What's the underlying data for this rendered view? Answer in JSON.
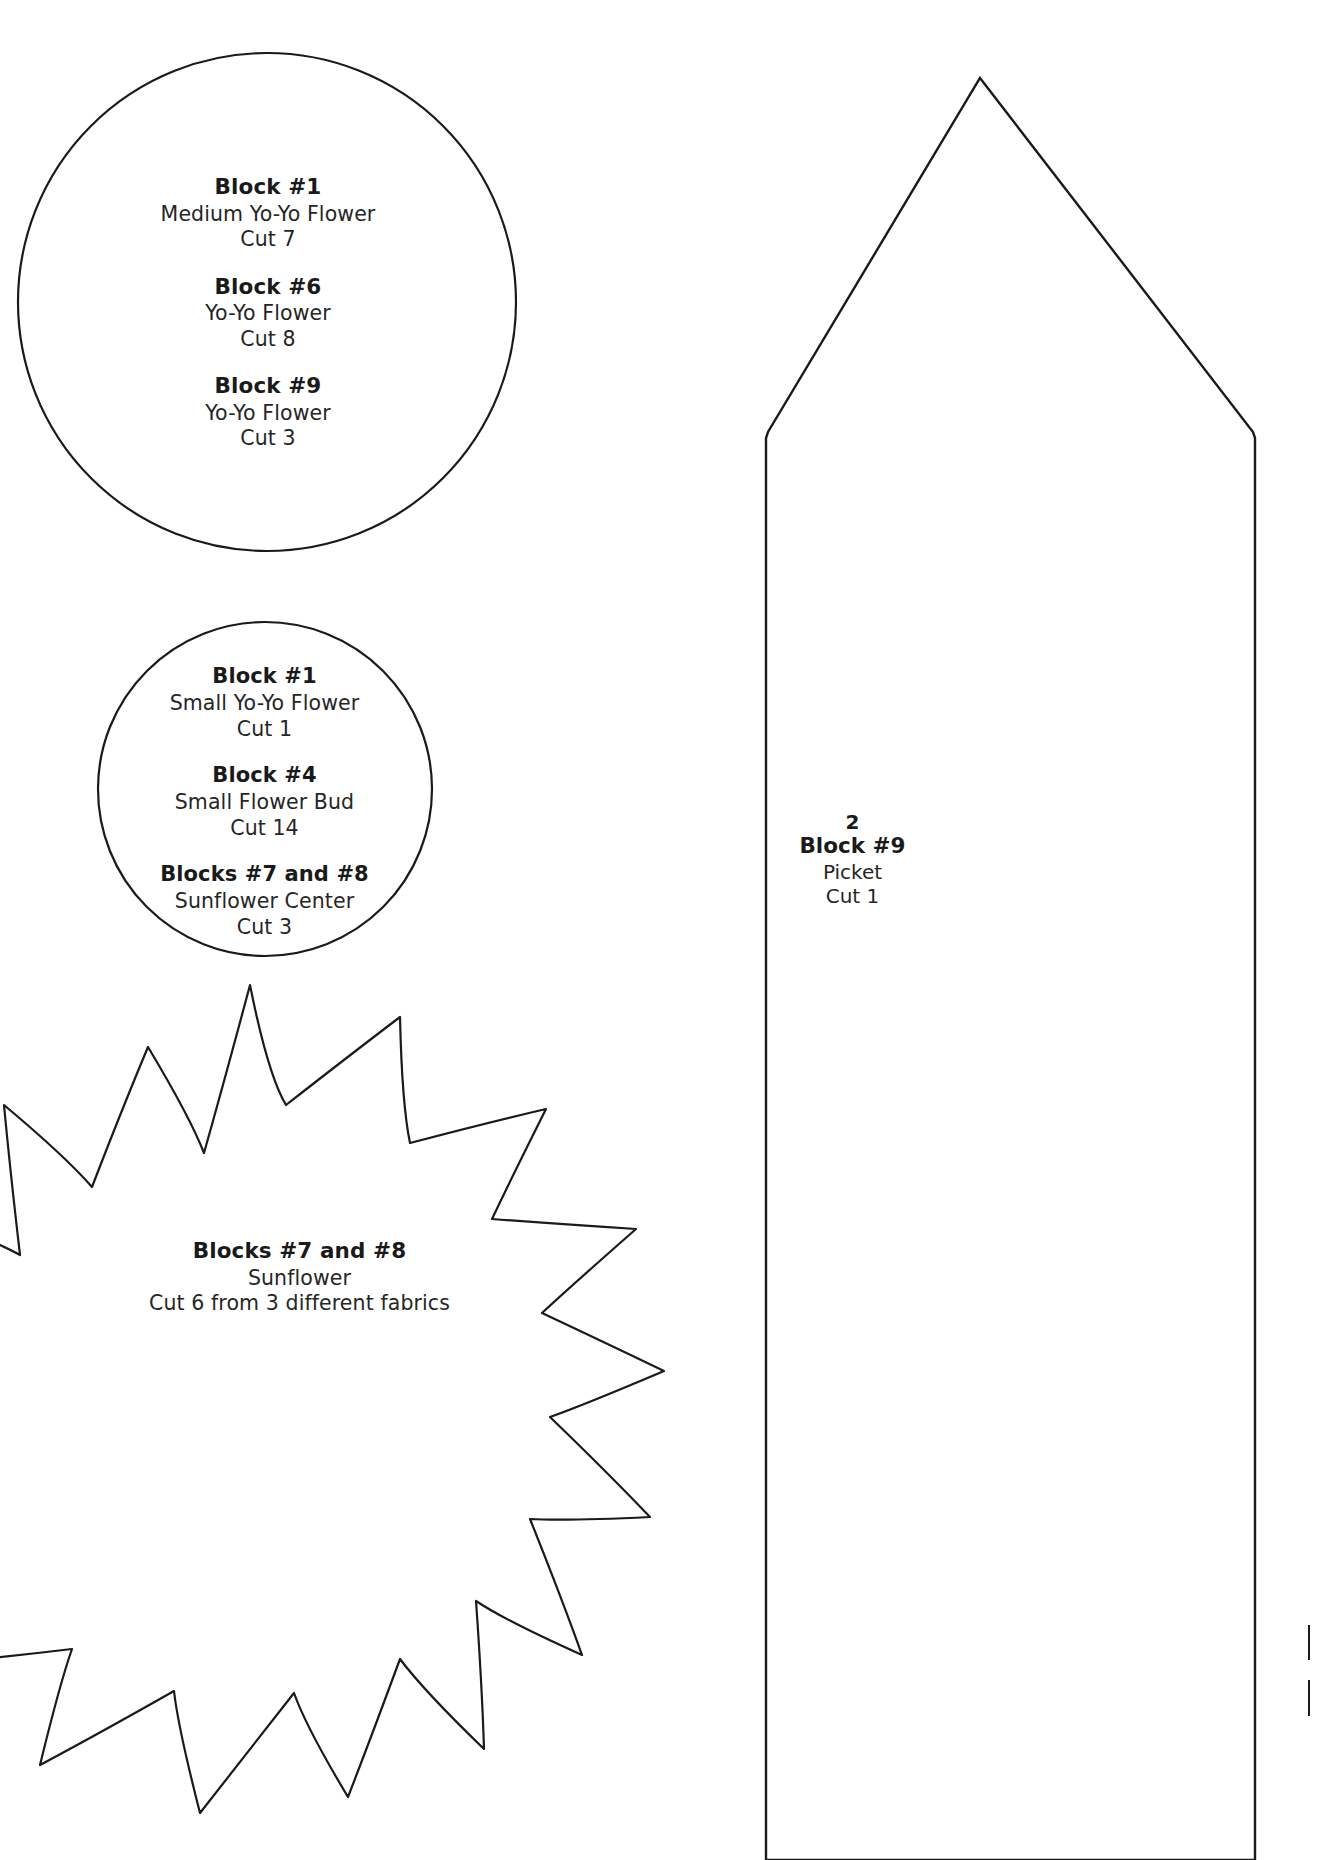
{
  "page": {
    "background_color": "#ffffff",
    "line_color": "#1a1a1a",
    "text_color": "#1a1a1a"
  },
  "templates": {
    "large_circle": {
      "shape_name": "large-circle-template",
      "groups": [
        {
          "title": "Block #1",
          "name": "Medium Yo-Yo Flower",
          "cut": "Cut 7"
        },
        {
          "title": "Block #6",
          "name": "Yo-Yo Flower",
          "cut": "Cut 8"
        },
        {
          "title": "Block #9",
          "name": "Yo-Yo Flower",
          "cut": "Cut 3"
        }
      ]
    },
    "small_circle": {
      "shape_name": "small-circle-template",
      "groups": [
        {
          "title": "Block #1",
          "name": "Small Yo-Yo Flower",
          "cut": "Cut 1"
        },
        {
          "title": "Block #4",
          "name": "Small Flower Bud",
          "cut": "Cut 14"
        },
        {
          "title": "Blocks #7 and #8",
          "name": "Sunflower Center",
          "cut": "Cut 3"
        }
      ]
    },
    "sunflower": {
      "shape_name": "sunflower-star-template",
      "points": 12,
      "groups": [
        {
          "title": "Blocks #7 and #8",
          "name": "Sunflower",
          "cut": "Cut 6 from 3 different fabrics"
        }
      ]
    },
    "picket": {
      "shape_name": "picket-template",
      "number": "2",
      "title": "Block #9",
      "name": "Picket",
      "cut": "Cut 1"
    }
  }
}
